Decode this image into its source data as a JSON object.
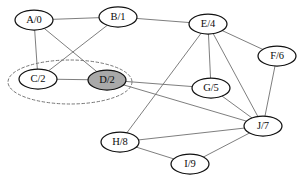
{
  "figure": {
    "background_color": "#ffffff",
    "width": 302,
    "height": 182
  },
  "style": {
    "edge_color": "#6f6f6f",
    "node_stroke_color": "#111111",
    "node_fill_default": "#ffffff",
    "node_fill_highlighted": "#a9a9a9",
    "cluster_stroke_color": "#777777",
    "label_color": "#0b0b0b"
  },
  "chart_data": {
    "type": "diagram",
    "graph_type": "undirected-graph",
    "title": "",
    "node_label_format": "name/value",
    "nodes": [
      {
        "id": "A",
        "label": "A/0",
        "name": "A",
        "value": "0",
        "cx": 34,
        "cy": 20,
        "rx": 19,
        "ry": 10,
        "highlighted": false
      },
      {
        "id": "B",
        "label": "B/1",
        "name": "B",
        "value": "1",
        "cx": 118,
        "cy": 17,
        "rx": 19,
        "ry": 10,
        "highlighted": false
      },
      {
        "id": "E",
        "label": "E/4",
        "name": "E",
        "value": "4",
        "cx": 208,
        "cy": 24,
        "rx": 19,
        "ry": 10,
        "highlighted": false
      },
      {
        "id": "F",
        "label": "F/6",
        "name": "F",
        "value": "6",
        "cx": 277,
        "cy": 56,
        "rx": 19,
        "ry": 10,
        "highlighted": false
      },
      {
        "id": "C",
        "label": "C/2",
        "name": "C",
        "value": "2",
        "cx": 38,
        "cy": 79,
        "rx": 19,
        "ry": 10,
        "highlighted": false
      },
      {
        "id": "D",
        "label": "D/2",
        "name": "D",
        "value": "2",
        "cx": 107,
        "cy": 80,
        "rx": 19,
        "ry": 10,
        "highlighted": true
      },
      {
        "id": "G",
        "label": "G/5",
        "name": "G",
        "value": "5",
        "cx": 211,
        "cy": 88,
        "rx": 19,
        "ry": 10,
        "highlighted": false
      },
      {
        "id": "J",
        "label": "J/7",
        "name": "J",
        "value": "7",
        "cx": 263,
        "cy": 126,
        "rx": 19,
        "ry": 10,
        "highlighted": false
      },
      {
        "id": "H",
        "label": "H/8",
        "name": "H",
        "value": "8",
        "cx": 120,
        "cy": 142,
        "rx": 19,
        "ry": 10,
        "highlighted": false
      },
      {
        "id": "I",
        "label": "I/9",
        "name": "I",
        "value": "9",
        "cx": 190,
        "cy": 164,
        "rx": 19,
        "ry": 10,
        "highlighted": false
      }
    ],
    "edges": [
      {
        "source": "A",
        "target": "B"
      },
      {
        "source": "A",
        "target": "C"
      },
      {
        "source": "A",
        "target": "D"
      },
      {
        "source": "B",
        "target": "C"
      },
      {
        "source": "B",
        "target": "E"
      },
      {
        "source": "C",
        "target": "D"
      },
      {
        "source": "D",
        "target": "G"
      },
      {
        "source": "D",
        "target": "J"
      },
      {
        "source": "E",
        "target": "F"
      },
      {
        "source": "E",
        "target": "G"
      },
      {
        "source": "E",
        "target": "J"
      },
      {
        "source": "E",
        "target": "H"
      },
      {
        "source": "F",
        "target": "J"
      },
      {
        "source": "G",
        "target": "J"
      },
      {
        "source": "H",
        "target": "I"
      },
      {
        "source": "H",
        "target": "J"
      },
      {
        "source": "I",
        "target": "J"
      }
    ],
    "clusters": [
      {
        "id": "cluster-cd",
        "members": [
          "C",
          "D"
        ],
        "shape": "ellipse",
        "style": "dashed",
        "cx": 70,
        "cy": 82,
        "rx": 62,
        "ry": 22
      }
    ]
  }
}
